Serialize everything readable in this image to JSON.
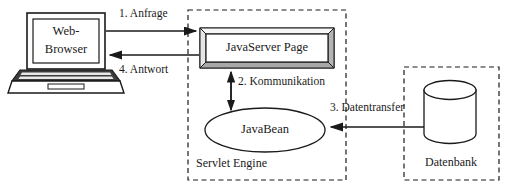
{
  "diagram": {
    "colors": {
      "stroke": "#1a1a1a",
      "fill": "#ffffff",
      "bevel_light": "#f2f2f2",
      "bevel_dark": "#c8c8c8",
      "bevel_mid": "#dcdcdc",
      "dashed_border": "#1a1a1a",
      "screen_fill": "#ffffff",
      "laptop_body": "#e8e8e8",
      "laptop_dark": "#3c3c3c"
    },
    "nodes": [
      {
        "id": "web-browser",
        "label_line1": "Web-",
        "label_line2": "Browser",
        "shape": "laptop"
      },
      {
        "id": "javaserver-page",
        "label": "JavaServer Page",
        "shape": "bevel-box"
      },
      {
        "id": "javabean",
        "label": "JavaBean",
        "shape": "ellipse"
      },
      {
        "id": "datenbank-cylinder",
        "label": "",
        "shape": "cylinder"
      }
    ],
    "groups": [
      {
        "id": "servlet-engine",
        "label": "Servlet Engine",
        "border": "dashed"
      },
      {
        "id": "datenbank",
        "label": "Datenbank",
        "border": "dashed"
      }
    ],
    "flows": [
      {
        "id": "flow-1",
        "label": "1. Anfrage",
        "from": "web-browser",
        "to": "javaserver-page",
        "direction": "right"
      },
      {
        "id": "flow-4",
        "label": "4. Antwort",
        "from": "javaserver-page",
        "to": "web-browser",
        "direction": "left"
      },
      {
        "id": "flow-2",
        "label": "2. Kommunikation",
        "from": "javaserver-page",
        "to": "javabean",
        "direction": "both"
      },
      {
        "id": "flow-3",
        "label": "3. Datentransfer",
        "from": "datenbank",
        "to": "javabean",
        "direction": "left"
      }
    ]
  }
}
